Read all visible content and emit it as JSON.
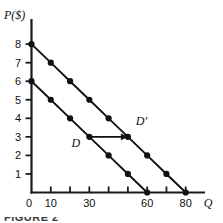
{
  "figure": {
    "caption": "FIGURE 2",
    "axis_color": "#1a1a1a",
    "curve_color": "#111111",
    "marker_color": "#111111"
  },
  "axes": {
    "y_title": "P($)",
    "x_title": "Q",
    "origin_label": "0",
    "y_ticks": [
      {
        "value": 1,
        "label": "1"
      },
      {
        "value": 2,
        "label": "2"
      },
      {
        "value": 3,
        "label": "3"
      },
      {
        "value": 4,
        "label": "4"
      },
      {
        "value": 5,
        "label": "5"
      },
      {
        "value": 6,
        "label": "6"
      },
      {
        "value": 7,
        "label": "7"
      },
      {
        "value": 8,
        "label": "8"
      }
    ],
    "x_ticks": [
      {
        "value": 10,
        "label": "10"
      },
      {
        "value": 20,
        "label": ""
      },
      {
        "value": 30,
        "label": "30"
      },
      {
        "value": 40,
        "label": ""
      },
      {
        "value": 50,
        "label": ""
      },
      {
        "value": 60,
        "label": "60"
      },
      {
        "value": 70,
        "label": ""
      },
      {
        "value": 80,
        "label": "80"
      }
    ]
  },
  "annotations": {
    "shift_arrow": {
      "label": "demand-shift-arrow",
      "from": {
        "q": 30,
        "p": 3
      },
      "to": {
        "q": 50,
        "p": 3
      }
    },
    "curve_labels": [
      {
        "text": "D",
        "q": 23,
        "p": 2.45
      },
      {
        "text": "D′",
        "q": 57,
        "p": 3.65
      }
    ]
  },
  "chart_data": {
    "type": "line",
    "title": "",
    "subtitle": "",
    "xlabel": "Q",
    "ylabel": "P($)",
    "xlim": [
      0,
      90
    ],
    "ylim": [
      0,
      8.6
    ],
    "grid": false,
    "legend": "none",
    "x_tick_values": [
      0,
      10,
      20,
      30,
      40,
      50,
      60,
      70,
      80
    ],
    "x_tick_labels": [
      "0",
      "10",
      "",
      "30",
      "",
      "",
      "60",
      "",
      "80"
    ],
    "y_tick_values": [
      0,
      1,
      2,
      3,
      4,
      5,
      6,
      7,
      8
    ],
    "y_tick_labels": [
      "0",
      "1",
      "2",
      "3",
      "4",
      "5",
      "6",
      "7",
      "8"
    ],
    "series": [
      {
        "name": "D",
        "markers": "filled-circle",
        "x": [
          0,
          10,
          20,
          30,
          40,
          50,
          60
        ],
        "y": [
          6,
          5,
          4,
          3,
          2,
          1,
          0
        ],
        "p_intercept": 6,
        "q_intercept": 60,
        "slope": -0.1
      },
      {
        "name": "D′",
        "markers": "filled-circle",
        "x": [
          0,
          10,
          20,
          30,
          40,
          50,
          60,
          70,
          80
        ],
        "y": [
          8,
          7,
          6,
          5,
          4,
          3,
          2,
          1,
          0
        ],
        "p_intercept": 8,
        "q_intercept": 80,
        "slope": -0.1
      }
    ],
    "annotations": [
      {
        "type": "arrow",
        "text": "",
        "from": [
          30,
          3
        ],
        "to": [
          50,
          3
        ]
      },
      {
        "type": "text",
        "text": "D",
        "x": 23,
        "y": 2.45
      },
      {
        "type": "text",
        "text": "D′",
        "x": 57,
        "y": 3.65
      }
    ]
  }
}
